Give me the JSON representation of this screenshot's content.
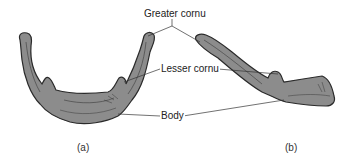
{
  "diagram": {
    "labels": {
      "greater_cornu": "Greater cornu",
      "lesser_cornu": "Lesser cornu",
      "body": "Body"
    },
    "captions": {
      "view_a": "(a)",
      "view_b": "(b)"
    },
    "colors": {
      "bone_fill": "#8c8c8c",
      "bone_outline": "#2a2a2a",
      "leader_line": "#333333",
      "background": "#ffffff"
    }
  }
}
